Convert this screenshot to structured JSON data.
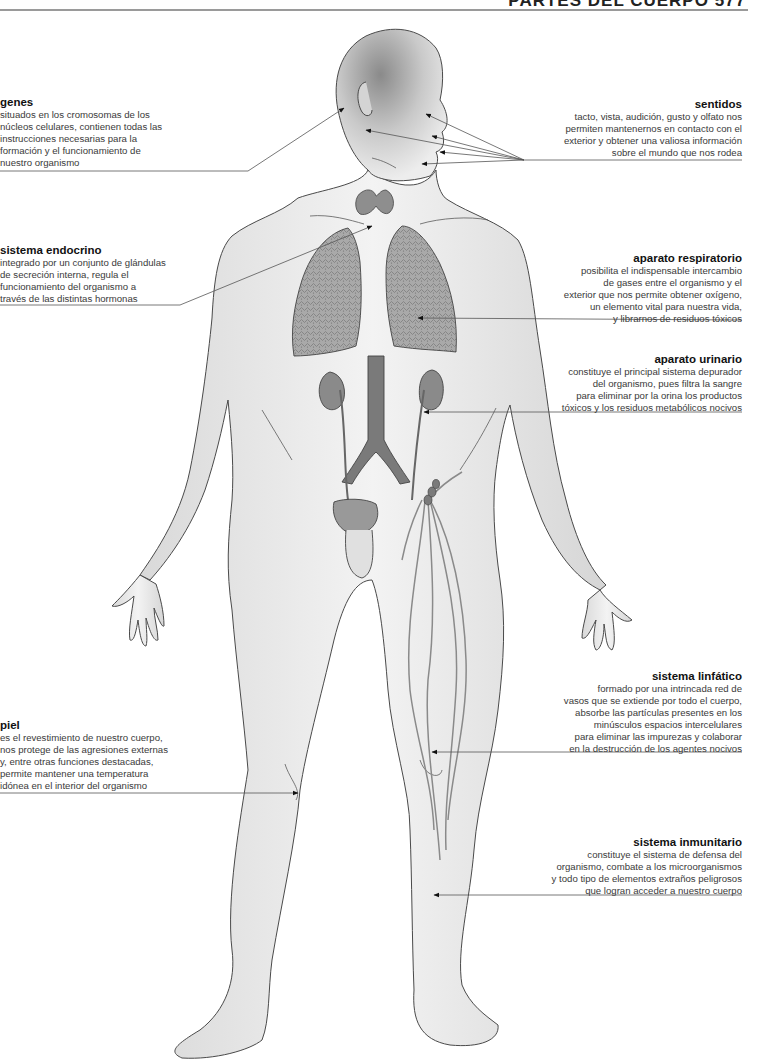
{
  "header": {
    "title": "PARTES DEL CUERPO 577"
  },
  "colors": {
    "text": "#3a3a3a",
    "title": "#111111",
    "leader": "#555555",
    "skin": "#ececec",
    "organ": "#8a8a8a"
  },
  "labels": {
    "genes": {
      "title": "genes",
      "body": "situados en los cromosomas de los\nnúcleos celulares, contienen todas las\ninstrucciones necesarias para la\nformación y el funcionamiento de\nnuestro organismo"
    },
    "sentidos": {
      "title": "sentidos",
      "body": "tacto, vista, audición, gusto y olfato nos\npermiten mantenernos en contacto con el\nexterior y obtener una valiosa información\nsobre el mundo que nos rodea"
    },
    "endocrino": {
      "title": "sistema endocrino",
      "body": "integrado por un conjunto de glándulas\nde secreción interna, regula el\nfuncionamiento del organismo a\ntravés de las distintas hormonas"
    },
    "respiratorio": {
      "title": "aparato respiratorio",
      "body": "posibilita el indispensable intercambio\nde gases entre el organismo y el\nexterior que nos permite obtener oxígeno,\nun elemento vital para nuestra vida,\ny librarnos de residuos tóxicos"
    },
    "urinario": {
      "title": "aparato urinario",
      "body": "constituye el principal sistema depurador\ndel organismo, pues filtra la sangre\npara eliminar por la orina los productos\ntóxicos y los residuos metabólicos nocivos"
    },
    "linfatico": {
      "title": "sistema linfático",
      "body": "formado por una intrincada red de\nvasos que se extiende por todo el cuerpo,\nabsorbe las partículas presentes en los\nminúsculos espacios intercelulares\npara eliminar las impurezas y colaborar\nen la destrucción de los agentes nocivos"
    },
    "piel": {
      "title": "piel",
      "body": "es el revestimiento de nuestro cuerpo,\nnos protege de las agresiones externas\ny, entre otras funciones destacadas,\npermite mantener una temperatura\nidónea en el interior del organismo"
    },
    "inmunitario": {
      "title": "sistema inmunitario",
      "body": "constituye el sistema de defensa del\norganismo, combate a los microorganismos\ny todo tipo de elementos extraños peligrosos\nque logran acceder a nuestro cuerpo"
    }
  }
}
